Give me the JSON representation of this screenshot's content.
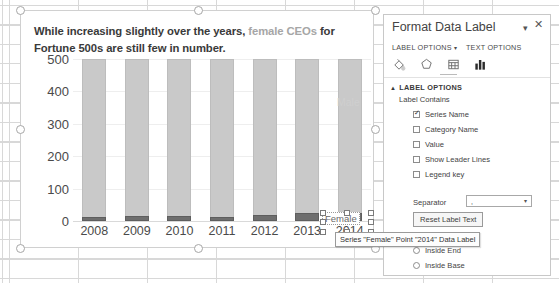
{
  "chart_data": {
    "type": "bar",
    "subtype": "stacked-column",
    "title": "While increasing slightly over the years, female CEOs for Fortune 500s are still few in number.",
    "title_parts": [
      {
        "text": "While increasing slightly over the years, ",
        "style": "bold-dark"
      },
      {
        "text": "female CEOs",
        "style": "bold-muted"
      },
      {
        "text": " for Fortune 500s are still few in number.",
        "style": "bold-dark"
      }
    ],
    "categories": [
      "2008",
      "2009",
      "2010",
      "2011",
      "2012",
      "2013",
      "2014"
    ],
    "series": [
      {
        "name": "Female",
        "color": "#6e6e6e",
        "values": [
          12,
          15,
          15,
          12,
          20,
          24,
          24
        ]
      },
      {
        "name": "Male",
        "color": "#c9c9c9",
        "values": [
          488,
          485,
          485,
          488,
          480,
          476,
          476
        ]
      }
    ],
    "yticks": [
      "0",
      "100",
      "200",
      "300",
      "400",
      "500"
    ],
    "ylim": [
      0,
      500
    ],
    "xlabel": "",
    "ylabel": "",
    "grid": true,
    "legend_position": "none",
    "series_labels": {
      "male": "Male",
      "female": "Female"
    },
    "selected_data_label": "Female",
    "tooltip": "Series \"Female\" Point \"2014\" Data Label"
  },
  "task_pane": {
    "title": "Format Data Label",
    "dropdown_icon": "chevron-down-icon",
    "close_icon": "close-icon",
    "tabs": [
      {
        "label": "LABEL OPTIONS",
        "caret": "▾",
        "active": true
      },
      {
        "label": "TEXT OPTIONS",
        "caret": "",
        "active": false
      }
    ],
    "icons": [
      {
        "name": "fill-icon",
        "active": false
      },
      {
        "name": "effects-icon",
        "active": false
      },
      {
        "name": "size-and-properties-icon",
        "active": false
      },
      {
        "name": "label-options-icon",
        "active": true
      }
    ],
    "section": {
      "triangle": "▲",
      "header": "LABEL OPTIONS",
      "label_contains_title": "Label Contains",
      "checkboxes": [
        {
          "label": "Series Name",
          "underline": "S",
          "checked": true
        },
        {
          "label": "Category Name",
          "underline": "C",
          "checked": false
        },
        {
          "label": "Value",
          "underline": "V",
          "checked": false
        },
        {
          "label": "Show Leader Lines",
          "underline": "h",
          "checked": false
        },
        {
          "label": "Legend key",
          "underline": "L",
          "checked": false
        }
      ],
      "separator_label": "Separator",
      "separator_value": ",",
      "separator_caret": "▾",
      "reset_button": "Reset Label Text",
      "label_position_title": "Label Position",
      "radios": [
        {
          "label": "Inside End",
          "underline": "I",
          "selected": false
        },
        {
          "label": "Inside Base",
          "underline": "n",
          "selected": false
        }
      ]
    }
  }
}
